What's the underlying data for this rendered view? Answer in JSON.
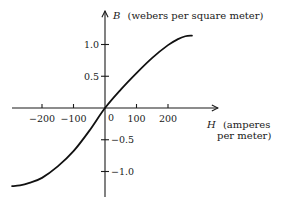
{
  "chart_data": {
    "type": "line",
    "title": "",
    "xlabel": {
      "var": "H",
      "line1": "(amperes",
      "line2": "per meter)"
    },
    "ylabel": {
      "var": "B",
      "text": "(webers per square meter)"
    },
    "xlim": [
      -300,
      360
    ],
    "ylim": [
      -1.4,
      1.52
    ],
    "grid": false,
    "legend": "none",
    "x_ticks": [
      {
        "value": -200,
        "label": "−200"
      },
      {
        "value": -100,
        "label": "−100"
      },
      {
        "value": 100,
        "label": "100"
      },
      {
        "value": 200,
        "label": "200"
      }
    ],
    "origin_label": "0",
    "y_ticks": [
      {
        "value": 1.0,
        "label": "1.0"
      },
      {
        "value": 0.5,
        "label": "0.5"
      },
      {
        "value": -0.5,
        "label": "−0.5"
      },
      {
        "value": -1.0,
        "label": "−1.0"
      }
    ],
    "series": [
      {
        "name": "B vs H magnetization curve",
        "x": [
          -295,
          -270,
          -240,
          -200,
          -150,
          -100,
          -50,
          0,
          50,
          100,
          150,
          200,
          230,
          255,
          276
        ],
        "y": [
          -1.23,
          -1.22,
          -1.18,
          -1.1,
          -0.92,
          -0.68,
          -0.36,
          0.0,
          0.29,
          0.55,
          0.79,
          0.99,
          1.08,
          1.13,
          1.14
        ]
      }
    ]
  }
}
